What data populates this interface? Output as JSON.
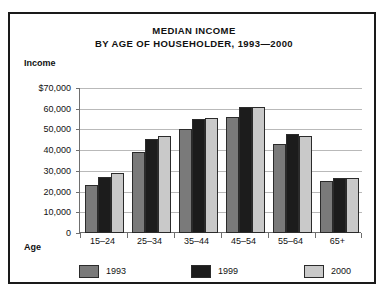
{
  "card": {
    "title_line1": "MEDIAN INCOME",
    "title_line2": "BY AGE OF HOUSEHOLDER, 1993—2000",
    "y_axis_title": "Income",
    "x_axis_title": "Age"
  },
  "colors": {
    "series_1993": "#7a7a7a",
    "series_1999": "#1c1c1c",
    "series_2000": "#c9c9c9",
    "bar_outline": "#2b2b2b",
    "gridline": "#b9b9b9",
    "axis": "#6f6f6f",
    "frame": "#1a1a1a",
    "background": "#ffffff",
    "text": "#111111"
  },
  "chart_data": {
    "type": "bar",
    "title": "MEDIAN INCOME BY AGE OF HOUSEHOLDER, 1993—2000",
    "xlabel": "Age",
    "ylabel": "Income",
    "ylim": [
      0,
      70000
    ],
    "grid": true,
    "legend_position": "bottom",
    "ytick_labels": [
      "$70,000",
      "60,000",
      "50,000",
      "40,000",
      "30,000",
      "20,000",
      "10,000",
      "0"
    ],
    "ytick_values": [
      70000,
      60000,
      50000,
      40000,
      30000,
      20000,
      10000,
      0
    ],
    "categories": [
      "15–24",
      "25–34",
      "35–44",
      "45–54",
      "55–64",
      "65+"
    ],
    "series": [
      {
        "name": "1993",
        "color": "#7a7a7a",
        "values": [
          23000,
          39000,
          50000,
          56000,
          43000,
          25000
        ]
      },
      {
        "name": "1999",
        "color": "#1c1c1c",
        "values": [
          27000,
          45500,
          55000,
          61000,
          48000,
          26500
        ]
      },
      {
        "name": "2000",
        "color": "#c9c9c9",
        "values": [
          29000,
          47000,
          55500,
          61000,
          47000,
          26500
        ]
      }
    ]
  }
}
